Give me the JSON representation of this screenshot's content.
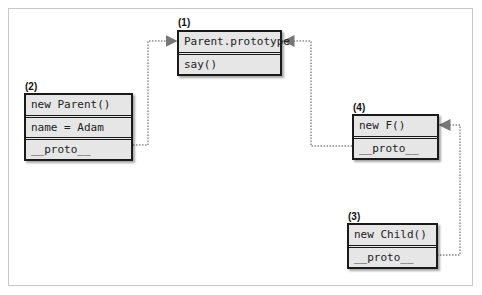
{
  "diagram": {
    "type": "prototype-chain",
    "nodes": [
      {
        "id": "1",
        "label": "(1)",
        "rows": [
          "Parent.prototype",
          "say()"
        ]
      },
      {
        "id": "2",
        "label": "(2)",
        "rows": [
          "new Parent()",
          "name = Adam",
          "__proto__"
        ]
      },
      {
        "id": "4",
        "label": "(4)",
        "rows": [
          "new F()",
          "__proto__"
        ]
      },
      {
        "id": "3",
        "label": "(3)",
        "rows": [
          "new Child()",
          "__proto__"
        ]
      }
    ],
    "edges": [
      {
        "from": "2.__proto__",
        "to": "1",
        "style": "dotted-arrow"
      },
      {
        "from": "4.__proto__",
        "to": "1",
        "style": "dotted-arrow"
      },
      {
        "from": "3.__proto__",
        "to": "4",
        "style": "dotted-arrow"
      }
    ],
    "colors": {
      "box_fill": "#e6e6e6",
      "box_border": "#1a1a1a",
      "edge": "#777777",
      "frame": "#c8c8c8"
    }
  }
}
